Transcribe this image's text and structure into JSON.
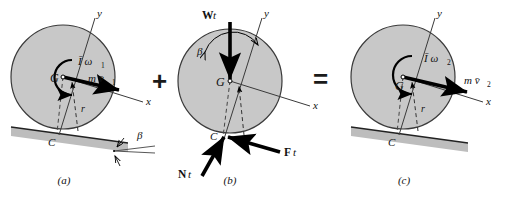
{
  "figure": {
    "operators": {
      "plus": "+",
      "equals": "="
    },
    "colors": {
      "disk_fill": "#c8c8c8",
      "disk_stroke": "#3a3a3a",
      "ground_fill": "#bdbdbd",
      "ground_edge": "#222222",
      "vector": "#000000",
      "axis": "#3a3a3a",
      "text": "#111111",
      "background": "#ffffff"
    },
    "panels": [
      {
        "id": "a",
        "caption": "(a)",
        "axis_y_label": "y",
        "axis_x_label": "x",
        "center_label": "G",
        "contact_label": "C",
        "radius_label": "r",
        "angle_label": "β",
        "momentum_labels": [
          {
            "name": "angular-momentum",
            "text": "Ī ω",
            "sub": "1"
          },
          {
            "name": "linear-momentum",
            "text": "m v̄",
            "sub": "1"
          }
        ]
      },
      {
        "id": "b",
        "caption": "(b)",
        "axis_y_label": "y",
        "axis_x_label": "x",
        "center_label": "G",
        "contact_label": "C",
        "angle_label": "β",
        "impulse_labels": [
          {
            "name": "weight-impulse",
            "bold": "W",
            "ital": "t"
          },
          {
            "name": "friction-impulse",
            "bold": "F",
            "ital": "t"
          },
          {
            "name": "normal-impulse",
            "bold": "N",
            "ital": "t"
          }
        ]
      },
      {
        "id": "c",
        "caption": "(c)",
        "axis_y_label": "y",
        "axis_x_label": "x",
        "center_label": "G",
        "contact_label": "C",
        "radius_label": "r",
        "momentum_labels": [
          {
            "name": "angular-momentum",
            "text": "Ī ω",
            "sub": "2"
          },
          {
            "name": "linear-momentum",
            "text": "m v̄",
            "sub": "2"
          }
        ]
      }
    ]
  }
}
